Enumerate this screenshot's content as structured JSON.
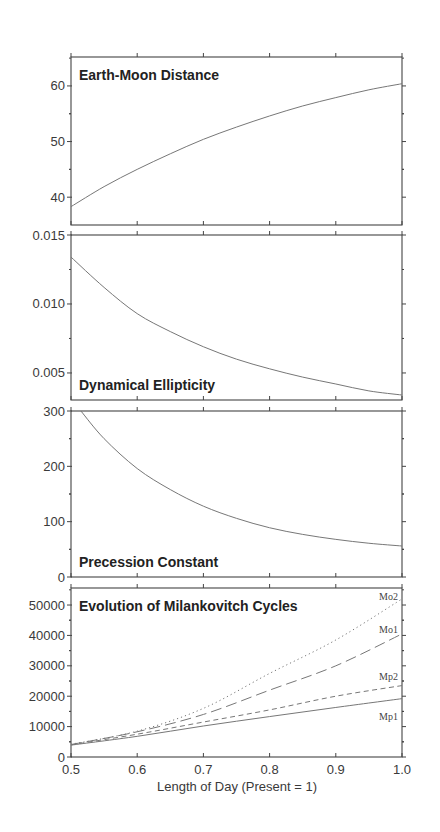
{
  "chart_data": [
    {
      "type": "line",
      "title": "Earth-Moon Distance",
      "xlabel": "Length of Day (Present = 1)",
      "ylabel": "",
      "xlim": [
        0.5,
        1.0
      ],
      "ylim": [
        35,
        65.2
      ],
      "yticks": [
        40,
        50,
        60
      ],
      "ytick_labels": [
        "40",
        "50",
        "60"
      ],
      "grid": false,
      "series": [
        {
          "name": "Earth-Moon Distance",
          "style": "solid",
          "x": [
            0.5,
            0.55,
            0.6,
            0.65,
            0.7,
            0.75,
            0.8,
            0.85,
            0.9,
            0.95,
            1.0
          ],
          "values": [
            38.3,
            41.9,
            45.0,
            47.8,
            50.4,
            52.6,
            54.6,
            56.4,
            57.9,
            59.3,
            60.4
          ]
        }
      ]
    },
    {
      "type": "line",
      "title": "Dynamical Ellipticity",
      "xlim": [
        0.5,
        1.0
      ],
      "ylim": [
        0.00304,
        0.015
      ],
      "yticks": [
        0.005,
        0.01,
        0.015
      ],
      "ytick_labels": [
        "0.005",
        "0.010",
        "0.015"
      ],
      "grid": false,
      "series": [
        {
          "name": "Dynamical Ellipticity",
          "style": "solid",
          "x": [
            0.5,
            0.55,
            0.6,
            0.65,
            0.7,
            0.75,
            0.8,
            0.85,
            0.9,
            0.95,
            1.0
          ],
          "values": [
            0.0134,
            0.0112,
            0.0093,
            0.008,
            0.0069,
            0.006,
            0.0053,
            0.0047,
            0.0042,
            0.0037,
            0.0034
          ]
        }
      ]
    },
    {
      "type": "line",
      "title": "Precession Constant",
      "xlim": [
        0.5,
        1.0
      ],
      "ylim": [
        0,
        300
      ],
      "yticks": [
        0,
        100,
        200,
        300
      ],
      "ytick_labels": [
        "0",
        "100",
        "200",
        "300"
      ],
      "grid": false,
      "series": [
        {
          "name": "Precession Constant",
          "style": "solid",
          "x": [
            0.515,
            0.55,
            0.6,
            0.65,
            0.7,
            0.75,
            0.8,
            0.85,
            0.9,
            0.95,
            1.0
          ],
          "values": [
            300,
            250,
            196,
            158,
            128,
            106,
            89,
            77,
            68,
            61,
            56
          ]
        }
      ]
    },
    {
      "type": "line",
      "title": "Evolution of Milankovitch Cycles",
      "xlabel": "Length of Day (Present = 1)",
      "xlim": [
        0.5,
        1.0
      ],
      "xticks": [
        0.5,
        0.6,
        0.7,
        0.8,
        0.9,
        1.0
      ],
      "xtick_labels": [
        "0.5",
        "0.6",
        "0.7",
        "0.8",
        "0.9",
        "1.0"
      ],
      "ylim": [
        0,
        55600
      ],
      "yticks": [
        0,
        10000,
        20000,
        30000,
        40000,
        50000
      ],
      "ytick_labels": [
        "0",
        "10000",
        "20000",
        "30000",
        "40000",
        "50000"
      ],
      "grid": false,
      "series": [
        {
          "name": "Mo2",
          "style": "dotted",
          "x": [
            0.5,
            0.6,
            0.7,
            0.8,
            0.9,
            1.0
          ],
          "values": [
            4200,
            8500,
            16000,
            27500,
            38500,
            52000
          ]
        },
        {
          "name": "Mo1",
          "style": "long-dash",
          "x": [
            0.5,
            0.6,
            0.7,
            0.8,
            0.9,
            1.0
          ],
          "values": [
            4100,
            8300,
            14000,
            22000,
            30000,
            40500
          ]
        },
        {
          "name": "Mp2",
          "style": "dashed",
          "x": [
            0.5,
            0.6,
            0.7,
            0.8,
            0.9,
            1.0
          ],
          "values": [
            4000,
            7500,
            11500,
            15500,
            20000,
            23500
          ]
        },
        {
          "name": "Mp1",
          "style": "solid",
          "x": [
            0.5,
            0.6,
            0.7,
            0.8,
            0.9,
            1.0
          ],
          "values": [
            3900,
            6800,
            10200,
            13300,
            16300,
            19200
          ]
        }
      ]
    }
  ],
  "panels": [
    {
      "title": "Earth-Moon Distance"
    },
    {
      "title": "Dynamical Ellipticity"
    },
    {
      "title": "Precession Constant"
    },
    {
      "title": "Evolution of Milankovitch Cycles"
    }
  ],
  "xaxis": {
    "label": "Length of Day (Present = 1)"
  }
}
